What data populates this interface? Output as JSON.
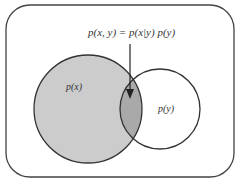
{
  "diagram": {
    "formula": "p(x, y) = p(x|y) p(y)",
    "sets": [
      {
        "name": "x",
        "label": "p(x)",
        "fill": "#cccccc"
      },
      {
        "name": "y",
        "label": "p(y)",
        "fill": "#ffffff"
      }
    ],
    "intersection": {
      "label": "p(x, y)",
      "fill": "#a9a9a9"
    },
    "colors": {
      "stroke": "#333333",
      "outer_frame": "#444444",
      "background": "#ffffff"
    }
  }
}
